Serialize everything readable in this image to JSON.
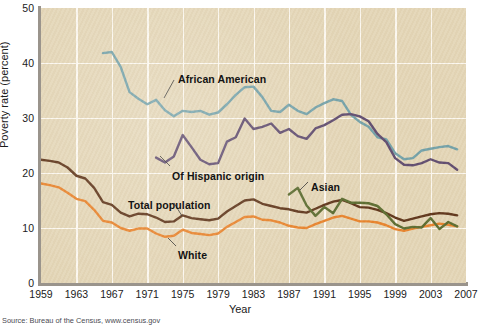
{
  "figure": {
    "source_note": "Source: Bureau of the Census, www.census.gov"
  },
  "chart_data": {
    "type": "line",
    "title": "",
    "xlabel": "Year",
    "ylabel": "Poverty rate (percent)",
    "xlim": [
      1959,
      2007
    ],
    "ylim": [
      0,
      50
    ],
    "yticks": [
      0,
      10,
      20,
      30,
      40,
      50
    ],
    "xticks": [
      1959,
      1963,
      1967,
      1971,
      1975,
      1979,
      1983,
      1987,
      1991,
      1995,
      1999,
      2003,
      2007
    ],
    "grid": true,
    "legend": "inline-annotations",
    "colors": {
      "african_american": "#71a0a8",
      "hispanic": "#5e4a6e",
      "total_population": "#5d3318",
      "white": "#e8822a",
      "asian": "#5a6b2e",
      "plot_background": "#e4d6b7",
      "gridline": "#fdfaf2",
      "axis": "#9a948c"
    },
    "series": [
      {
        "name": "African American",
        "label": "African American",
        "color": "#71a0a8",
        "x": [
          1966,
          1967,
          1968,
          1969,
          1970,
          1971,
          1972,
          1973,
          1974,
          1975,
          1976,
          1977,
          1978,
          1979,
          1980,
          1981,
          1982,
          1983,
          1984,
          1985,
          1986,
          1987,
          1988,
          1989,
          1990,
          1991,
          1992,
          1993,
          1994,
          1995,
          1996,
          1997,
          1998,
          1999,
          2000,
          2001,
          2002,
          2003,
          2004,
          2005,
          2006
        ],
        "values": [
          41.8,
          42.0,
          39.3,
          34.7,
          33.5,
          32.5,
          33.3,
          31.4,
          30.3,
          31.3,
          31.1,
          31.3,
          30.6,
          31.0,
          32.5,
          34.2,
          35.6,
          35.7,
          33.8,
          31.3,
          31.1,
          32.4,
          31.3,
          30.7,
          31.9,
          32.7,
          33.4,
          33.1,
          30.6,
          29.3,
          28.4,
          26.5,
          26.1,
          23.6,
          22.5,
          22.7,
          24.1,
          24.4,
          24.7,
          24.9,
          24.3
        ]
      },
      {
        "name": "Of Hispanic origin",
        "label": "Of Hispanic origin",
        "color": "#5e4a6e",
        "x": [
          1972,
          1973,
          1974,
          1975,
          1976,
          1977,
          1978,
          1979,
          1980,
          1981,
          1982,
          1983,
          1984,
          1985,
          1986,
          1987,
          1988,
          1989,
          1990,
          1991,
          1992,
          1993,
          1994,
          1995,
          1996,
          1997,
          1998,
          1999,
          2000,
          2001,
          2002,
          2003,
          2004,
          2005,
          2006
        ],
        "values": [
          22.8,
          21.9,
          23.0,
          26.9,
          24.7,
          22.4,
          21.6,
          21.8,
          25.7,
          26.5,
          29.9,
          28.0,
          28.4,
          29.0,
          27.3,
          28.0,
          26.7,
          26.2,
          28.1,
          28.7,
          29.6,
          30.6,
          30.7,
          30.3,
          29.4,
          27.1,
          25.6,
          22.7,
          21.5,
          21.4,
          21.8,
          22.5,
          21.9,
          21.8,
          20.6
        ]
      },
      {
        "name": "Asian",
        "label": "Asian",
        "color": "#5a6b2e",
        "x": [
          1987,
          1988,
          1989,
          1990,
          1991,
          1992,
          1993,
          1994,
          1995,
          1996,
          1997,
          1998,
          1999,
          2000,
          2001,
          2002,
          2003,
          2004,
          2005,
          2006
        ],
        "values": [
          16.1,
          17.3,
          14.1,
          12.2,
          13.8,
          12.7,
          15.3,
          14.6,
          14.6,
          14.5,
          14.0,
          12.5,
          10.7,
          9.9,
          10.2,
          10.1,
          11.8,
          9.8,
          11.1,
          10.3
        ]
      },
      {
        "name": "Total population",
        "label": "Total population",
        "color": "#5d3318",
        "x": [
          1959,
          1960,
          1961,
          1962,
          1963,
          1964,
          1965,
          1966,
          1967,
          1968,
          1969,
          1970,
          1971,
          1972,
          1973,
          1974,
          1975,
          1976,
          1977,
          1978,
          1979,
          1980,
          1981,
          1982,
          1983,
          1984,
          1985,
          1986,
          1987,
          1988,
          1989,
          1990,
          1991,
          1992,
          1993,
          1994,
          1995,
          1996,
          1997,
          1998,
          1999,
          2000,
          2001,
          2002,
          2003,
          2004,
          2005,
          2006
        ],
        "values": [
          22.4,
          22.2,
          21.9,
          21.0,
          19.5,
          19.0,
          17.3,
          14.7,
          14.2,
          12.8,
          12.1,
          12.6,
          12.5,
          11.9,
          11.1,
          11.2,
          12.3,
          11.8,
          11.6,
          11.4,
          11.7,
          13.0,
          14.0,
          15.0,
          15.2,
          14.4,
          14.0,
          13.6,
          13.4,
          13.0,
          12.8,
          13.5,
          14.2,
          14.8,
          15.1,
          14.5,
          13.8,
          13.7,
          13.3,
          12.7,
          11.9,
          11.3,
          11.7,
          12.1,
          12.5,
          12.7,
          12.6,
          12.3
        ]
      },
      {
        "name": "White",
        "label": "White",
        "color": "#e8822a",
        "x": [
          1959,
          1960,
          1961,
          1962,
          1963,
          1964,
          1965,
          1966,
          1967,
          1968,
          1969,
          1970,
          1971,
          1972,
          1973,
          1974,
          1975,
          1976,
          1977,
          1978,
          1979,
          1980,
          1981,
          1982,
          1983,
          1984,
          1985,
          1986,
          1987,
          1988,
          1989,
          1990,
          1991,
          1992,
          1993,
          1994,
          1995,
          1996,
          1997,
          1998,
          1999,
          2000,
          2001,
          2002,
          2003,
          2004,
          2005,
          2006
        ],
        "values": [
          18.1,
          17.8,
          17.4,
          16.4,
          15.3,
          14.9,
          13.3,
          11.3,
          11.0,
          10.0,
          9.5,
          9.9,
          9.9,
          9.0,
          8.4,
          8.6,
          9.7,
          9.1,
          8.9,
          8.7,
          9.0,
          10.2,
          11.1,
          12.0,
          12.1,
          11.5,
          11.4,
          11.0,
          10.4,
          10.1,
          10.0,
          10.7,
          11.3,
          11.9,
          12.2,
          11.7,
          11.2,
          11.2,
          11.0,
          10.5,
          9.8,
          9.5,
          9.9,
          10.2,
          10.5,
          10.8,
          10.6,
          10.3
        ]
      }
    ],
    "annotations": [
      {
        "text": "African American",
        "x_px": 178,
        "y_px": 73
      },
      {
        "text": "Of Hispanic origin",
        "x_px": 172,
        "y_px": 170
      },
      {
        "text": "Asian",
        "x_px": 311,
        "y_px": 181
      },
      {
        "text": "Total population",
        "x_px": 128,
        "y_px": 199
      },
      {
        "text": "White",
        "x_px": 178,
        "y_px": 249
      }
    ]
  }
}
